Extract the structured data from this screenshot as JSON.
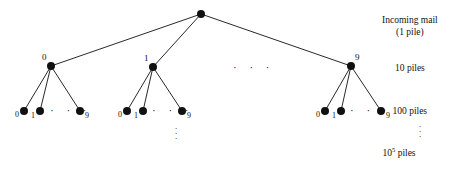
{
  "figure": {
    "background": "#ffffff",
    "ink_color": "#111111",
    "width": 470,
    "height": 171
  },
  "tree": {
    "root": {
      "label": "",
      "x": 201,
      "y": 14,
      "r": 4
    },
    "level1": [
      {
        "label": "0",
        "x": 51,
        "y": 66,
        "r": 4,
        "label_dx": -9,
        "label_dy": -13
      },
      {
        "label": "1",
        "x": 153,
        "y": 67,
        "r": 4,
        "label_dx": -9,
        "label_dy": -13
      },
      {
        "label": "9",
        "x": 351,
        "y": 66,
        "r": 4,
        "label_dx": 4,
        "label_dy": -13
      }
    ],
    "level1_ellipsis": {
      "text": "· · ·",
      "x": 233,
      "y": 62
    },
    "leaf_groups": [
      {
        "parent": "0",
        "leaves": [
          {
            "label": "0",
            "x": 24,
            "y": 111,
            "r": 4,
            "label_dx": -9,
            "label_dy": 0
          },
          {
            "label": "1",
            "x": 40,
            "y": 111,
            "r": 4,
            "label_dx": -9,
            "label_dy": 1
          },
          {
            "label": "9",
            "x": 80,
            "y": 111,
            "r": 4,
            "label_dx": 5,
            "label_dy": 1
          }
        ],
        "ellipsis": {
          "text": "· · ·",
          "x": 50,
          "y": 105
        }
      },
      {
        "parent": "1",
        "leaves": [
          {
            "label": "0",
            "x": 127,
            "y": 111,
            "r": 4,
            "label_dx": -9,
            "label_dy": 0
          },
          {
            "label": "1",
            "x": 143,
            "y": 111,
            "r": 4,
            "label_dx": -9,
            "label_dy": 1
          },
          {
            "label": "9",
            "x": 182,
            "y": 111,
            "r": 4,
            "label_dx": 5,
            "label_dy": 1
          }
        ],
        "ellipsis": {
          "text": "· · ·",
          "x": 152,
          "y": 105
        }
      },
      {
        "parent": "9",
        "leaves": [
          {
            "label": "0",
            "x": 325,
            "y": 111,
            "r": 4,
            "label_dx": -9,
            "label_dy": 0
          },
          {
            "label": "1",
            "x": 341,
            "y": 111,
            "r": 4,
            "label_dx": -9,
            "label_dy": 1
          },
          {
            "label": "9",
            "x": 381,
            "y": 111,
            "r": 4,
            "label_dx": 5,
            "label_dy": 1
          }
        ],
        "ellipsis": {
          "text": "· · ·",
          "x": 350,
          "y": 105
        }
      }
    ],
    "bottom_ellipsis": {
      "x": 175,
      "y": 124
    }
  },
  "annotations": {
    "incoming_mail": {
      "line1": "Incoming mail",
      "line2": "(1 pile)",
      "x": 410,
      "y": 16
    },
    "ten_piles": {
      "text": "10 piles",
      "x": 410,
      "y": 64
    },
    "hundred_piles": {
      "text": "100 piles",
      "x": 410,
      "y": 107
    },
    "side_ellipsis": {
      "x": 419,
      "y": 122
    },
    "ten_pow_five_piles": {
      "base": "10",
      "exponent": "5",
      "unit": " piles",
      "x": 399,
      "y": 149
    }
  }
}
